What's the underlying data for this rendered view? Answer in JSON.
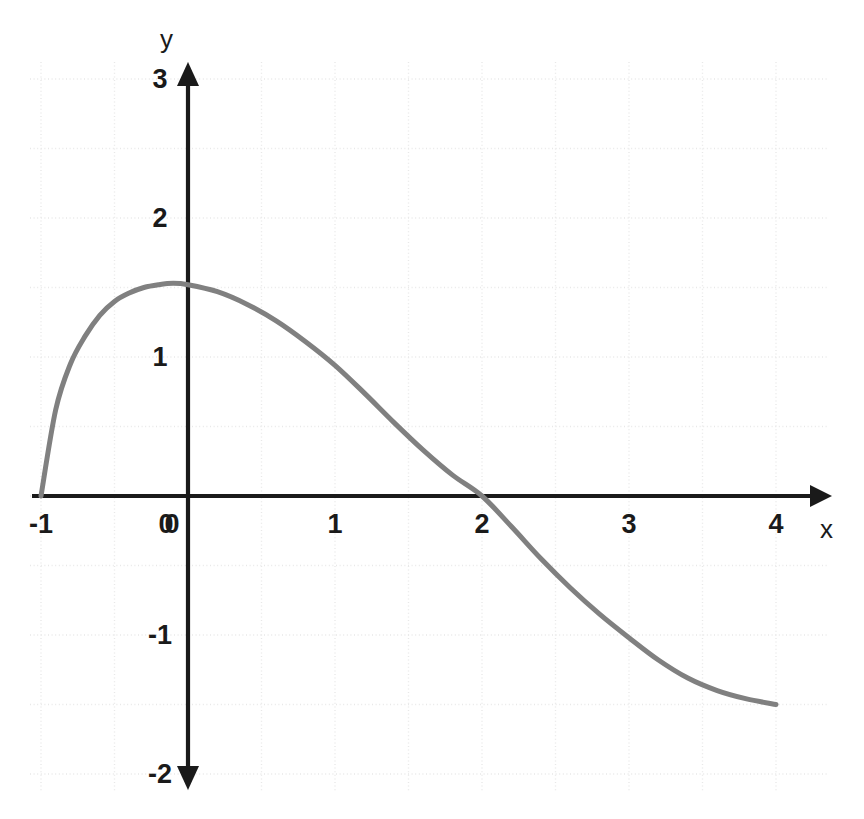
{
  "chart_data": {
    "type": "line",
    "title": "",
    "xlabel": "x",
    "ylabel": "y",
    "xlim": [
      -1.25,
      4.6
    ],
    "ylim": [
      -2.3,
      3.2
    ],
    "grid": true,
    "grid_step": 0.5,
    "legend": "none",
    "axis_style": "arrowed-cartesian-axes",
    "xticks": [
      -1,
      0,
      1,
      2,
      3,
      4
    ],
    "xtick_labels": [
      "-1",
      "0",
      "1",
      "2",
      "3",
      "4"
    ],
    "yticks": [
      -2,
      -1,
      0,
      1,
      2,
      3
    ],
    "ytick_labels": [
      "-2",
      "-1",
      "0",
      "1",
      "2",
      "3"
    ],
    "series": [
      {
        "name": "curve",
        "color": "#808080",
        "x": [
          -1.0,
          -0.9,
          -0.8,
          -0.7,
          -0.6,
          -0.5,
          -0.4,
          -0.3,
          -0.2,
          -0.1,
          0.0,
          0.2,
          0.4,
          0.6,
          0.8,
          1.0,
          1.2,
          1.4,
          1.6,
          1.8,
          2.0,
          2.2,
          2.4,
          2.6,
          2.8,
          3.0,
          3.2,
          3.4,
          3.6,
          3.8,
          4.0
        ],
        "y": [
          0.0,
          0.62,
          0.95,
          1.15,
          1.3,
          1.4,
          1.46,
          1.5,
          1.52,
          1.53,
          1.52,
          1.47,
          1.38,
          1.26,
          1.11,
          0.94,
          0.74,
          0.53,
          0.33,
          0.15,
          0.0,
          -0.22,
          -0.45,
          -0.66,
          -0.85,
          -1.02,
          -1.18,
          -1.31,
          -1.4,
          -1.46,
          -1.5
        ]
      }
    ],
    "annotations": {
      "x_intercepts": [
        -1.0,
        2.0
      ],
      "maximum": {
        "x": -0.1,
        "y": 1.53
      },
      "y_intercept": 1.52
    }
  },
  "axes": {
    "x_axis_label": "x",
    "y_axis_label": "y"
  },
  "ticks": {
    "x": [
      {
        "label": "-1",
        "value": -1
      },
      {
        "label": "0",
        "value": 0
      },
      {
        "label": "1",
        "value": 1
      },
      {
        "label": "2",
        "value": 2
      },
      {
        "label": "3",
        "value": 3
      },
      {
        "label": "4",
        "value": 4
      }
    ],
    "y": [
      {
        "label": "3",
        "value": 3
      },
      {
        "label": "2",
        "value": 2
      },
      {
        "label": "1",
        "value": 1
      },
      {
        "label": "0",
        "value": 0
      },
      {
        "label": "-1",
        "value": -1
      },
      {
        "label": "-2",
        "value": -2
      }
    ]
  },
  "colors": {
    "curve": "#808080",
    "axis": "#1a1a1a",
    "grid": "#e8e8e8",
    "background": "#ffffff",
    "label": "#1a1a1a"
  }
}
